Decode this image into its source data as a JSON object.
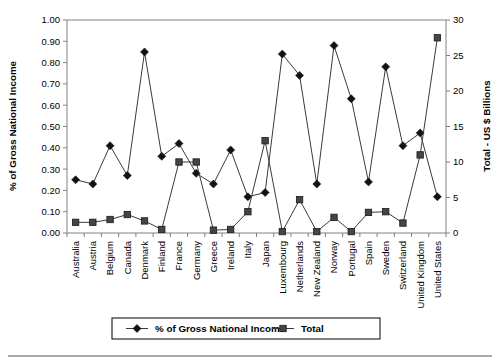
{
  "chart_data": {
    "type": "line",
    "title": "",
    "xlabel": "",
    "ylabel": "% of Gross National Income",
    "y2label": "Total - US $ Billions",
    "ylim": [
      0,
      1.0
    ],
    "y2lim": [
      0,
      30
    ],
    "ytick_labels": [
      "0.00",
      "0.10",
      "0.20",
      "0.30",
      "0.40",
      "0.50",
      "0.60",
      "0.70",
      "0.80",
      "0.90",
      "1.00"
    ],
    "y2tick_labels": [
      "0",
      "5",
      "10",
      "15",
      "20",
      "25",
      "30"
    ],
    "grid": false,
    "legend_position": "bottom",
    "categories": [
      "Australia",
      "Austria",
      "Belgium",
      "Canada",
      "Denmark",
      "Finland",
      "France",
      "Germany",
      "Greece",
      "Ireland",
      "Italy",
      "Japan",
      "Luxembourg",
      "Netherlands",
      "New Zealand",
      "Norway",
      "Portugal",
      "Spain",
      "Sweden",
      "Switzerland",
      "United Kingdom",
      "United States"
    ],
    "series": [
      {
        "name": "% of Gross National Income",
        "axis": "left",
        "marker": "diamond",
        "values": [
          0.25,
          0.23,
          0.41,
          0.27,
          0.85,
          0.36,
          0.42,
          0.28,
          0.23,
          0.39,
          0.17,
          0.19,
          0.84,
          0.74,
          0.23,
          0.88,
          0.63,
          0.24,
          0.78,
          0.41,
          0.47,
          0.17
        ]
      },
      {
        "name": "Total",
        "axis": "right",
        "marker": "square",
        "values": [
          1.5,
          1.5,
          1.9,
          2.6,
          1.7,
          0.5,
          10.0,
          10.0,
          0.4,
          0.5,
          3.0,
          13.0,
          0.2,
          4.7,
          0.2,
          2.2,
          0.2,
          2.9,
          3.0,
          1.4,
          11.0,
          27.5
        ]
      }
    ],
    "legend": [
      {
        "label": "% of Gross National Income",
        "marker": "diamond"
      },
      {
        "label": "Total",
        "marker": "square"
      }
    ],
    "colors": {
      "series1": "#121212",
      "series2": "#454545",
      "axis": "#808080",
      "background": "#ffffff"
    }
  }
}
